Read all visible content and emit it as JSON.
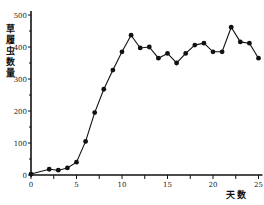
{
  "chart_data": {
    "type": "line",
    "title": "",
    "xlabel": "天数",
    "ylabel": "草履虫数量",
    "xlim": [
      0,
      25
    ],
    "ylim": [
      0,
      500
    ],
    "xticks": [
      0,
      5,
      10,
      15,
      20,
      25
    ],
    "yticks": [
      0,
      100,
      200,
      300,
      400,
      500
    ],
    "minor_xticks": [
      2.5,
      7.5,
      12.5,
      17.5,
      22.5
    ],
    "minor_yticks": [
      50,
      150,
      250,
      350,
      450
    ],
    "grid": false,
    "legend": null,
    "marker": "filled-circle",
    "color": "#111111",
    "x": [
      0,
      2,
      3,
      4,
      5,
      6,
      7,
      8,
      9,
      10,
      11,
      12,
      13,
      14,
      15,
      16,
      17,
      18,
      19,
      20,
      21,
      22,
      23,
      24,
      25
    ],
    "series": [
      {
        "name": "草履虫数量",
        "values": [
          3,
          18,
          15,
          22,
          40,
          105,
          195,
          268,
          328,
          385,
          437,
          397,
          400,
          365,
          380,
          350,
          380,
          406,
          412,
          385,
          385,
          462,
          416,
          412,
          365
        ]
      }
    ]
  },
  "labels": {
    "ylabel_chars": [
      "草",
      "履",
      "虫",
      "数",
      "量"
    ],
    "xlabel": "天数"
  }
}
